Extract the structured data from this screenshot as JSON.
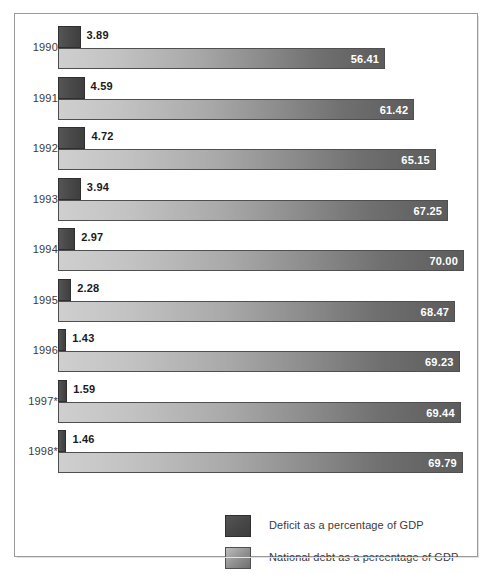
{
  "chart_data": {
    "type": "bar",
    "orientation": "horizontal",
    "title": "",
    "subtitle": "",
    "xlabel": "",
    "ylabel": "",
    "xlim": [
      0,
      70
    ],
    "grid": false,
    "legend_position": "bottom-right",
    "categories": [
      "1990",
      "1991",
      "1992",
      "1993",
      "1994",
      "1995",
      "1996",
      "1997*",
      "1998*"
    ],
    "series": [
      {
        "name": "Deficit as a percentage of GDP",
        "color": "#4a4a4a",
        "values": [
          3.89,
          4.59,
          4.72,
          3.94,
          2.97,
          2.28,
          1.43,
          1.59,
          1.46
        ],
        "labels": [
          "3.89",
          "4.59",
          "4.72",
          "3.94",
          "2.97",
          "2.28",
          "1.43",
          "1.59",
          "1.46"
        ]
      },
      {
        "name": "National debt as a percentage of GDP",
        "color": "#8c8c8c",
        "values": [
          56.41,
          61.42,
          65.15,
          67.25,
          70.0,
          68.47,
          69.23,
          69.44,
          69.79
        ],
        "labels": [
          "56.41",
          "61.42",
          "65.15",
          "67.25",
          "70.00",
          "68.47",
          "69.23",
          "69.44",
          "69.79"
        ]
      }
    ]
  },
  "legend": {
    "items": [
      {
        "label": "Deficit as a percentage of GDP",
        "swatch": "deficit-swatch"
      },
      {
        "label": "National debt as a percentage of GDP",
        "swatch": "debt-swatch"
      }
    ]
  }
}
